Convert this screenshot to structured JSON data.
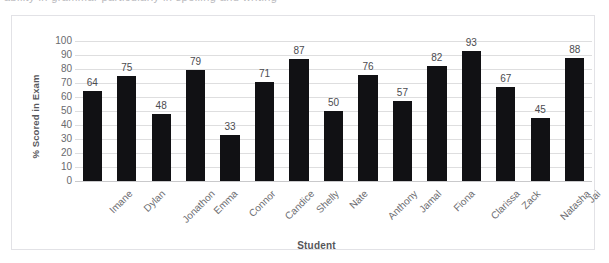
{
  "scan": {
    "top_sliver_text": "ability in grammar particularly in spelling and writing"
  },
  "chart_data": {
    "type": "bar",
    "title": "",
    "xlabel": "Student",
    "ylabel": "% Scored in Exam",
    "categories": [
      "Imane",
      "Dylan",
      "Jonathon",
      "Emma",
      "Connor",
      "Candice",
      "Shelly",
      "Nate",
      "Anthony",
      "Jamal",
      "Fiona",
      "Clarissa",
      "Zack",
      "Natasha",
      "Jai"
    ],
    "values": [
      64,
      75,
      48,
      79,
      33,
      71,
      87,
      50,
      76,
      57,
      82,
      93,
      67,
      45,
      88
    ],
    "ylim": [
      0,
      100
    ],
    "ytick_labels": [
      "100",
      "90",
      "80",
      "70",
      "60",
      "50",
      "40",
      "30",
      "20",
      "10",
      "0"
    ],
    "ytick_values": [
      100,
      90,
      80,
      70,
      60,
      50,
      40,
      30,
      20,
      10,
      0
    ],
    "grid": true,
    "legend": false,
    "bar_color": "#111114",
    "gridline_color": "#dededf",
    "data_labels": true
  }
}
